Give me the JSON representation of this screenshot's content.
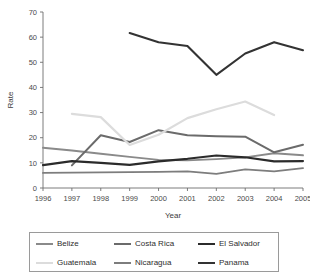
{
  "chart_data": {
    "type": "line",
    "title": "",
    "xlabel": "Year",
    "ylabel": "Rate",
    "x": [
      1996,
      1997,
      1998,
      1999,
      2000,
      2001,
      2002,
      2003,
      2004,
      2005
    ],
    "xtick_labels": [
      "1996",
      "1997",
      "1998",
      "1999",
      "2000",
      "2001",
      "2002",
      "2003",
      "2004",
      "2005"
    ],
    "ytick_labels": [
      "0",
      "10",
      "20",
      "30",
      "40",
      "50",
      "60",
      "70"
    ],
    "yticks": [
      0,
      10,
      20,
      30,
      40,
      50,
      60,
      70
    ],
    "ylim": [
      0,
      70
    ],
    "xlim": [
      1996,
      2005
    ],
    "grid": false,
    "legend_position": "bottom",
    "series": [
      {
        "name": "Belize",
        "color": "#8a8a8a",
        "width": 1.9,
        "x": [
          1996,
          1997,
          1998,
          1999,
          2000,
          2001,
          2002,
          2003,
          2004,
          2005
        ],
        "values": [
          16.0,
          14.9,
          13.6,
          12.4,
          11.2,
          11.0,
          11.5,
          12.2,
          13.8,
          13.0
        ]
      },
      {
        "name": "Costa Rica",
        "color": "#6b6b6b",
        "width": 2.0,
        "x": [
          1997,
          1998,
          1999,
          2000,
          2001,
          2002,
          2003,
          2004,
          2005
        ],
        "values": [
          9.0,
          21.0,
          18.3,
          23.0,
          21.0,
          20.6,
          20.4,
          14.2,
          17.2
        ]
      },
      {
        "name": "El Salvador",
        "color": "#2b2b2b",
        "width": 2.1,
        "x": [
          1996,
          1997,
          1998,
          1999,
          2000,
          2001,
          2002,
          2003,
          2004,
          2005
        ],
        "values": [
          9.1,
          10.7,
          10.0,
          9.2,
          10.6,
          11.6,
          12.9,
          12.2,
          10.6,
          10.7
        ]
      },
      {
        "name": "Guatemala",
        "color": "#dcdcdc",
        "width": 2.2,
        "x": [
          1997,
          1998,
          1999,
          2000,
          2001,
          2002,
          2003,
          2004
        ],
        "values": [
          29.5,
          28.2,
          17.1,
          21.2,
          27.8,
          31.3,
          34.4,
          29.0
        ]
      },
      {
        "name": "Nicaragua",
        "color": "#7d7d7d",
        "width": 1.9,
        "x": [
          1996,
          1997,
          1998,
          1999,
          2000,
          2001,
          2002,
          2003,
          2004,
          2005
        ],
        "values": [
          6.0,
          6.1,
          6.2,
          6.3,
          6.4,
          6.6,
          5.6,
          7.4,
          6.6,
          7.9
        ]
      },
      {
        "name": "Panama",
        "color": "#333333",
        "width": 2.1,
        "x": [
          1999,
          2000,
          2001,
          2002,
          2003,
          2004,
          2005
        ],
        "values": [
          61.6,
          58.0,
          56.5,
          45.0,
          53.5,
          58.0,
          54.8
        ]
      }
    ]
  },
  "legend": {
    "items": [
      {
        "label": "Belize",
        "color": "#8a8a8a"
      },
      {
        "label": "Costa Rica",
        "color": "#6b6b6b"
      },
      {
        "label": "El Salvador",
        "color": "#2b2b2b"
      },
      {
        "label": "Guatemala",
        "color": "#dcdcdc"
      },
      {
        "label": "Nicaragua",
        "color": "#7d7d7d"
      },
      {
        "label": "Panama",
        "color": "#333333"
      }
    ],
    "order": [
      0,
      1,
      2,
      3,
      4,
      5
    ]
  }
}
